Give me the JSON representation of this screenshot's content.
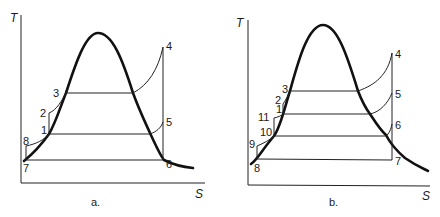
{
  "figure": {
    "panels": [
      {
        "caption": "a.",
        "y_axis_label": "T",
        "x_axis_label": "S",
        "points": {
          "p1": "1",
          "p2": "2",
          "p3": "3",
          "p4": "4",
          "p5": "5",
          "p6": "6",
          "p7": "7",
          "p8": "8"
        }
      },
      {
        "caption": "b.",
        "y_axis_label": "T",
        "x_axis_label": "S",
        "points": {
          "p1": "1",
          "p2": "2",
          "p3": "3",
          "p4": "4",
          "p5": "5",
          "p6": "6",
          "p7": "7",
          "p8": "8",
          "p9": "9",
          "p10": "10",
          "p11": "11"
        }
      }
    ]
  }
}
